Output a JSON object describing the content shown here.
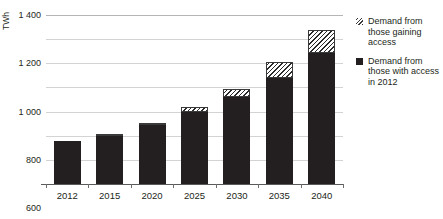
{
  "chart_data": {
    "type": "bar",
    "stacked": true,
    "title": "",
    "xlabel": "",
    "ylabel": "TWh",
    "ylim": [
      0,
      1400
    ],
    "ytick_step": 200,
    "ytick_labels": [
      "1 400",
      "1 200",
      "1 000",
      "800",
      "600",
      "400",
      "200"
    ],
    "ytick_values": [
      1400,
      1200,
      1000,
      800,
      600,
      400,
      200
    ],
    "grid": true,
    "legend_position": "right",
    "categories": [
      "2012",
      "2015",
      "2020",
      "2025",
      "2030",
      "2035",
      "2040"
    ],
    "series": [
      {
        "name": "Demand from those with access in 2012",
        "style": "solid",
        "color": "#231f20",
        "values": [
          355,
          395,
          485,
          595,
          720,
          880,
          1085
        ]
      },
      {
        "name": "Demand from those gaining access",
        "style": "hatched",
        "color": "#ffffff",
        "values": [
          0,
          10,
          12,
          45,
          70,
          130,
          195
        ]
      }
    ],
    "totals": [
      355,
      405,
      497,
      640,
      790,
      1010,
      1280
    ]
  },
  "axes": {
    "y_title": "TWh",
    "y_ticks": [
      {
        "label": "1 400",
        "value": 1400
      },
      {
        "label": "1 200",
        "value": 1200
      },
      {
        "label": "1 000",
        "value": 1000
      },
      {
        "label": "800",
        "value": 800
      },
      {
        "label": "600",
        "value": 600
      },
      {
        "label": "400",
        "value": 400
      },
      {
        "label": "200",
        "value": 200
      }
    ],
    "x_ticks": [
      {
        "label": "2012"
      },
      {
        "label": "2015"
      },
      {
        "label": "2020"
      },
      {
        "label": "2025"
      },
      {
        "label": "2030"
      },
      {
        "label": "2035"
      },
      {
        "label": "2040"
      }
    ]
  },
  "legend": {
    "items": [
      {
        "swatch": "hatched-swatch-icon",
        "label": "Demand from those gaining access"
      },
      {
        "swatch": "solid-swatch-icon",
        "label": "Demand from those with access in 2012"
      }
    ]
  },
  "title_strip": {
    "text": ""
  },
  "colors": {
    "bar_solid": "#231f20",
    "bar_hatch_line": "#2b2b2b",
    "grid": "#d3d3d3",
    "axis": "#5a5a5a",
    "text": "#231f20",
    "background": "#ffffff"
  }
}
